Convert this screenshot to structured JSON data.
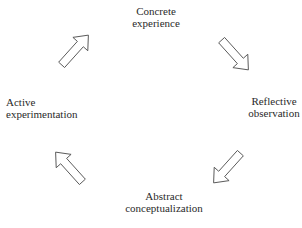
{
  "diagram": {
    "type": "cycle",
    "stages": [
      {
        "id": "concrete",
        "lines": [
          "Concrete",
          "experience"
        ]
      },
      {
        "id": "reflective",
        "lines": [
          "Reflective",
          "observation"
        ]
      },
      {
        "id": "abstract",
        "lines": [
          "Abstract",
          "conceptualization"
        ]
      },
      {
        "id": "active",
        "lines": [
          "Active",
          "experimentation"
        ]
      }
    ],
    "arrows": [
      {
        "from": "active",
        "to": "concrete",
        "direction": "up-right"
      },
      {
        "from": "concrete",
        "to": "reflective",
        "direction": "down-right"
      },
      {
        "from": "reflective",
        "to": "abstract",
        "direction": "down-left"
      },
      {
        "from": "abstract",
        "to": "active",
        "direction": "up-left"
      }
    ],
    "arrow_style": {
      "fill": "#ffffff",
      "stroke": "#555555"
    },
    "caption_partial": "..."
  }
}
